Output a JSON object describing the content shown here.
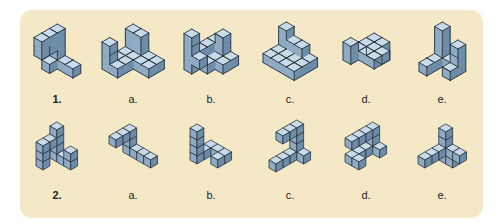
{
  "colors": {
    "background": "#f4e8c6",
    "top": "#c9dbe8",
    "left": "#8fabc4",
    "right": "#6d8ca8",
    "edge": "#2a3542"
  },
  "rows": [
    {
      "id": "1",
      "style": "solid",
      "figures": [
        {
          "label": "1.",
          "bold": true,
          "cx": 57,
          "cy": 55,
          "unit": 9,
          "cubes": [
            [
              0,
              0,
              0
            ],
            [
              1,
              0,
              0
            ],
            [
              2,
              0,
              0
            ],
            [
              0,
              1,
              0
            ],
            [
              0,
              0,
              1
            ],
            [
              0,
              0,
              2
            ],
            [
              0,
              1,
              2
            ],
            [
              0,
              2,
              2
            ],
            [
              0,
              0,
              3
            ],
            [
              0,
              1,
              3
            ],
            [
              0,
              2,
              3
            ]
          ]
        },
        {
          "label": "a.",
          "bold": false,
          "cx": 133,
          "cy": 55,
          "unit": 9,
          "cubes": [
            [
              0,
              0,
              0
            ],
            [
              1,
              0,
              0
            ],
            [
              2,
              0,
              0
            ],
            [
              3,
              0,
              0
            ],
            [
              0,
              1,
              0
            ],
            [
              1,
              1,
              0
            ],
            [
              2,
              1,
              0
            ],
            [
              3,
              1,
              0
            ],
            [
              0,
              2,
              0
            ],
            [
              1,
              2,
              0
            ],
            [
              0,
              3,
              0
            ],
            [
              1,
              3,
              0
            ],
            [
              0,
              3,
              1
            ],
            [
              0,
              3,
              2
            ],
            [
              0,
              0,
              1
            ],
            [
              1,
              0,
              1
            ],
            [
              0,
              0,
              2
            ],
            [
              1,
              0,
              2
            ]
          ]
        },
        {
          "label": "b.",
          "bold": false,
          "cx": 211,
          "cy": 55,
          "unit": 9,
          "cubes": [
            [
              0,
              0,
              0
            ],
            [
              1,
              0,
              0
            ],
            [
              2,
              0,
              0
            ],
            [
              0,
              1,
              0
            ],
            [
              1,
              1,
              0
            ],
            [
              2,
              1,
              0
            ],
            [
              0,
              2,
              0
            ],
            [
              1,
              2,
              0
            ],
            [
              0,
              3,
              0
            ],
            [
              0,
              0,
              1
            ],
            [
              0,
              1,
              1
            ],
            [
              0,
              2,
              1
            ],
            [
              0,
              3,
              1
            ],
            [
              1,
              0,
              1
            ],
            [
              1,
              0,
              2
            ],
            [
              0,
              3,
              2
            ],
            [
              0,
              3,
              3
            ],
            [
              1,
              3,
              1
            ]
          ]
        },
        {
          "label": "c.",
          "bold": false,
          "cx": 290,
          "cy": 55,
          "unit": 9,
          "cubes": [
            [
              0,
              0,
              0
            ],
            [
              1,
              0,
              0
            ],
            [
              2,
              0,
              0
            ],
            [
              3,
              0,
              0
            ],
            [
              0,
              1,
              0
            ],
            [
              1,
              1,
              0
            ],
            [
              2,
              1,
              0
            ],
            [
              3,
              1,
              0
            ],
            [
              0,
              2,
              0
            ],
            [
              1,
              2,
              0
            ],
            [
              2,
              2,
              0
            ],
            [
              3,
              2,
              0
            ],
            [
              0,
              0,
              1
            ],
            [
              1,
              0,
              1
            ],
            [
              2,
              0,
              1
            ],
            [
              0,
              0,
              2
            ]
          ]
        },
        {
          "label": "d.",
          "bold": false,
          "cx": 366,
          "cy": 55,
          "unit": 9,
          "cubes": [
            [
              0,
              0,
              0
            ],
            [
              1,
              0,
              0
            ],
            [
              1,
              0,
              1
            ],
            [
              0,
              0,
              1
            ],
            [
              0,
              1,
              1
            ],
            [
              1,
              1,
              1
            ],
            [
              2,
              1,
              1
            ],
            [
              0,
              2,
              1
            ],
            [
              1,
              2,
              1
            ],
            [
              2,
              2,
              1
            ],
            [
              0,
              3,
              1
            ],
            [
              0,
              3,
              2
            ]
          ]
        },
        {
          "label": "e.",
          "bold": false,
          "cx": 442,
          "cy": 55,
          "unit": 9,
          "cubes": [
            [
              0,
              0,
              0
            ],
            [
              1,
              0,
              0
            ],
            [
              2,
              0,
              0
            ],
            [
              0,
              1,
              0
            ],
            [
              0,
              2,
              0
            ],
            [
              2,
              1,
              0
            ],
            [
              0,
              0,
              1
            ],
            [
              0,
              0,
              2
            ],
            [
              0,
              0,
              3
            ],
            [
              2,
              0,
              1
            ],
            [
              2,
              0,
              2
            ]
          ]
        }
      ]
    },
    {
      "id": "2",
      "style": "cubes",
      "figures": [
        {
          "label": "2.",
          "bold": true,
          "cx": 57,
          "cy": 150,
          "unit": 8,
          "cubes": [
            [
              0,
              2,
              0
            ],
            [
              0,
              2,
              1
            ],
            [
              0,
              2,
              2
            ],
            [
              0,
              1,
              2
            ],
            [
              0,
              0,
              0
            ],
            [
              0,
              0,
              1
            ],
            [
              0,
              0,
              2
            ],
            [
              0,
              0,
              3
            ],
            [
              1,
              0,
              0
            ],
            [
              2,
              0,
              0
            ],
            [
              2,
              0,
              1
            ]
          ]
        },
        {
          "label": "a.",
          "bold": false,
          "cx": 133,
          "cy": 150,
          "unit": 8,
          "cubes": [
            [
              3,
              0,
              0
            ],
            [
              2,
              0,
              0
            ],
            [
              1,
              0,
              0
            ],
            [
              0,
              0,
              0
            ],
            [
              0,
              0,
              1
            ],
            [
              0,
              0,
              2
            ],
            [
              0,
              1,
              2
            ],
            [
              0,
              2,
              2
            ]
          ]
        },
        {
          "label": "b.",
          "bold": false,
          "cx": 211,
          "cy": 150,
          "unit": 8,
          "cubes": [
            [
              0,
              2,
              0
            ],
            [
              0,
              2,
              1
            ],
            [
              0,
              2,
              2
            ],
            [
              0,
              2,
              3
            ],
            [
              0,
              1,
              0
            ],
            [
              0,
              0,
              0
            ],
            [
              1,
              0,
              0
            ],
            [
              2,
              0,
              0
            ],
            [
              2,
              1,
              0
            ]
          ]
        },
        {
          "label": "c.",
          "bold": false,
          "cx": 290,
          "cy": 150,
          "unit": 8,
          "cubes": [
            [
              0,
              0,
              0
            ],
            [
              0,
              0,
              1
            ],
            [
              0,
              0,
              2
            ],
            [
              0,
              0,
              3
            ],
            [
              0,
              1,
              3
            ],
            [
              0,
              2,
              3
            ],
            [
              1,
              0,
              0
            ],
            [
              0,
              1,
              0
            ],
            [
              0,
              2,
              0
            ],
            [
              0,
              3,
              0
            ]
          ]
        },
        {
          "label": "d.",
          "bold": false,
          "cx": 366,
          "cy": 150,
          "unit": 8,
          "cubes": [
            [
              0,
              0,
              0
            ],
            [
              0,
              0,
              1
            ],
            [
              0,
              0,
              2
            ],
            [
              0,
              1,
              2
            ],
            [
              0,
              2,
              2
            ],
            [
              0,
              3,
              2
            ],
            [
              0,
              1,
              0
            ],
            [
              0,
              2,
              0
            ],
            [
              0,
              3,
              0
            ],
            [
              1,
              3,
              0
            ],
            [
              1,
              0,
              0
            ]
          ]
        },
        {
          "label": "e.",
          "bold": false,
          "cx": 442,
          "cy": 150,
          "unit": 8,
          "cubes": [
            [
              0,
              0,
              0
            ],
            [
              0,
              0,
              1
            ],
            [
              0,
              0,
              2
            ],
            [
              0,
              0,
              3
            ],
            [
              1,
              0,
              1
            ],
            [
              2,
              0,
              1
            ],
            [
              1,
              0,
              0
            ],
            [
              0,
              1,
              1
            ],
            [
              0,
              2,
              1
            ],
            [
              0,
              3,
              1
            ]
          ]
        }
      ]
    }
  ],
  "labels": {
    "row1": [
      "1.",
      "a.",
      "b.",
      "c.",
      "d.",
      "e."
    ],
    "row2": [
      "2.",
      "a.",
      "b.",
      "c.",
      "d.",
      "e."
    ]
  }
}
